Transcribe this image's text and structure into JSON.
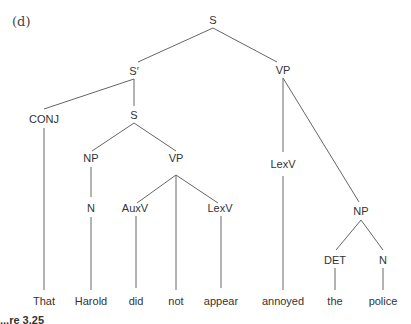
{
  "figure": {
    "label": "(d)",
    "caption_fragment": "...re 3.25"
  },
  "tree": {
    "nodes": {
      "s_root": "S",
      "s_bar": "S′",
      "vp_top": "VP",
      "conj": "CONJ",
      "s_inner": "S",
      "lexv_annoyed": "LexV",
      "np_subj": "NP",
      "vp_inner": "VP",
      "n_harold": "N",
      "auxv": "AuxV",
      "lexv_appear": "LexV",
      "np_obj": "NP",
      "det": "DET",
      "n_police": "N"
    },
    "words": {
      "w1": "That",
      "w2": "Harold",
      "w3": "did",
      "w4": "not",
      "w5": "appear",
      "w6": "annoyed",
      "w7": "the",
      "w8": "police"
    }
  }
}
